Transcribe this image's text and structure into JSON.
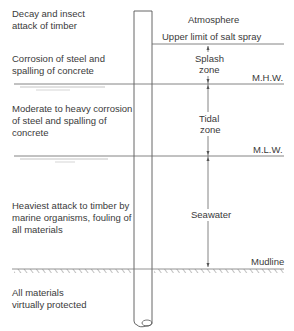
{
  "diagram": {
    "left_descriptions": [
      {
        "line1": "Decay and insect",
        "line2": "attack of timber",
        "line3": ""
      },
      {
        "line1": "Corrosion of steel and",
        "line2": "spalling of concrete",
        "line3": ""
      },
      {
        "line1": "Moderate to heavy corrosion",
        "line2": "of steel and spalling of",
        "line3": "concrete"
      },
      {
        "line1": "Heaviest attack to timber by",
        "line2": "marine organisms, fouling of",
        "line3": "all materials"
      },
      {
        "line1": "All materials",
        "line2": "virtually protected",
        "line3": ""
      }
    ],
    "right_labels": {
      "atmosphere": "Atmosphere",
      "upper_limit": "Upper limit of salt spray",
      "splash_1": "Splash",
      "splash_2": "zone",
      "mhw": "M.H.W.",
      "tidal_1": "Tidal",
      "tidal_2": "zone",
      "mlw": "M.L.W.",
      "seawater": "Seawater",
      "mudline": "Mudline"
    },
    "colors": {
      "line": "#555555",
      "text": "#3a3a3a"
    }
  }
}
